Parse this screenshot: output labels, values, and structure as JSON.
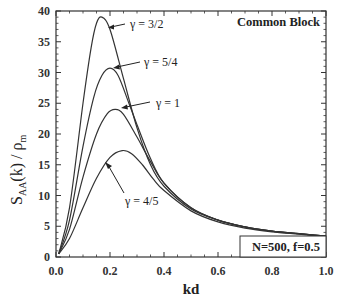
{
  "chart_data": {
    "type": "line",
    "title": "Common Block",
    "xlabel": "kd",
    "ylabel": "S_AA(k) / ρ_m",
    "xlim": [
      0.0,
      1.0
    ],
    "ylim": [
      0,
      40
    ],
    "x_ticks": [
      "0.0",
      "0.2",
      "0.4",
      "0.6",
      "0.8",
      "1.0"
    ],
    "y_ticks": [
      "0",
      "5",
      "10",
      "15",
      "20",
      "25",
      "30",
      "35",
      "40"
    ],
    "grid": false,
    "legend": "none (inline annotations)",
    "annotation_box": "N=500,  f=0.5",
    "series": [
      {
        "name": "γ = 3/2",
        "x": [
          0.01,
          0.05,
          0.1,
          0.13,
          0.15,
          0.17,
          0.2,
          0.25,
          0.3,
          0.35,
          0.4,
          0.5,
          0.6,
          0.7,
          0.8,
          0.9,
          1.0
        ],
        "values": [
          0.5,
          8,
          25,
          34,
          38,
          39,
          37,
          29,
          21,
          15,
          11.5,
          7.8,
          6.0,
          4.9,
          4.2,
          3.8,
          3.4
        ]
      },
      {
        "name": "γ = 5/4",
        "x": [
          0.01,
          0.05,
          0.1,
          0.14,
          0.17,
          0.2,
          0.23,
          0.27,
          0.3,
          0.35,
          0.4,
          0.5,
          0.6,
          0.7,
          0.8,
          0.9,
          1.0
        ],
        "values": [
          0.5,
          6,
          18,
          26,
          29.5,
          30.7,
          29.5,
          25,
          21.5,
          16,
          12,
          8.0,
          6.0,
          4.9,
          4.2,
          3.8,
          3.4
        ]
      },
      {
        "name": "γ = 1",
        "x": [
          0.01,
          0.05,
          0.1,
          0.15,
          0.19,
          0.22,
          0.25,
          0.3,
          0.35,
          0.4,
          0.5,
          0.6,
          0.7,
          0.8,
          0.9,
          1.0
        ],
        "values": [
          0.5,
          4.5,
          13,
          20,
          23.3,
          24,
          23.2,
          19.5,
          15.5,
          12,
          8.0,
          6.0,
          4.9,
          4.2,
          3.8,
          3.4
        ]
      },
      {
        "name": "γ = 4/5",
        "x": [
          0.01,
          0.05,
          0.1,
          0.15,
          0.2,
          0.245,
          0.28,
          0.32,
          0.36,
          0.4,
          0.5,
          0.6,
          0.7,
          0.8,
          0.9,
          1.0
        ],
        "values": [
          0.5,
          3,
          8,
          12.8,
          16.2,
          17.3,
          16.8,
          15,
          12.7,
          10.8,
          7.5,
          5.7,
          4.7,
          4.1,
          3.7,
          3.3
        ]
      }
    ],
    "annotations": [
      {
        "text": "γ = 3/2",
        "arrow_to": [
          0.17,
          39
        ]
      },
      {
        "text": "γ = 5/4",
        "arrow_to": [
          0.2,
          30.7
        ]
      },
      {
        "text": "γ = 1",
        "arrow_to": [
          0.22,
          24
        ]
      },
      {
        "text": "γ = 4/5",
        "arrow_to": [
          0.19,
          16.3
        ]
      }
    ]
  },
  "labels": {
    "title": "Common Block",
    "xlabel": "kd",
    "ylabel_main": "S",
    "ylabel_sub": "AA",
    "ylabel_rest": "(k) / ρ",
    "ylabel_sub2": "m",
    "box": "N=500,  f=0.5",
    "g32": "γ = 3/2",
    "g54": "γ = 5/4",
    "g1": "γ = 1",
    "g45": "γ = 4/5"
  }
}
